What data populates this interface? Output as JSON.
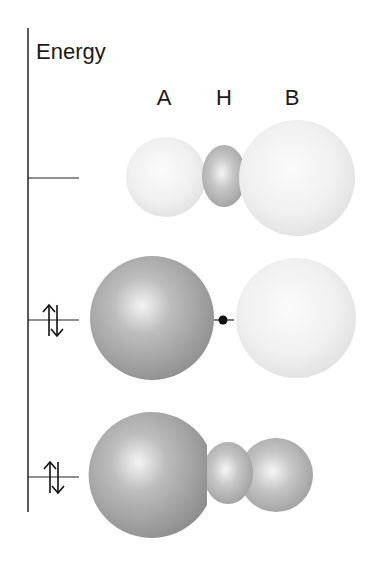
{
  "axis": {
    "label": "Energy"
  },
  "columns": [
    {
      "label": "A"
    },
    {
      "label": "H"
    },
    {
      "label": "B"
    }
  ],
  "levels": [
    {
      "name": "antibonding",
      "electrons": "",
      "description": "A and B lobes light, small H lobe darker between"
    },
    {
      "name": "nonbonding",
      "electrons": "↑↓",
      "description": "A sphere dark, node at H (dot), B sphere light"
    },
    {
      "name": "bonding",
      "electrons": "↑↓",
      "description": "A, H and B lobes all shaded, merged"
    }
  ],
  "colors": {
    "axis": "#222222",
    "dark_lobe": "#9a9a9a",
    "light_lobe": "#ececec",
    "text": "#1a1a1a"
  }
}
